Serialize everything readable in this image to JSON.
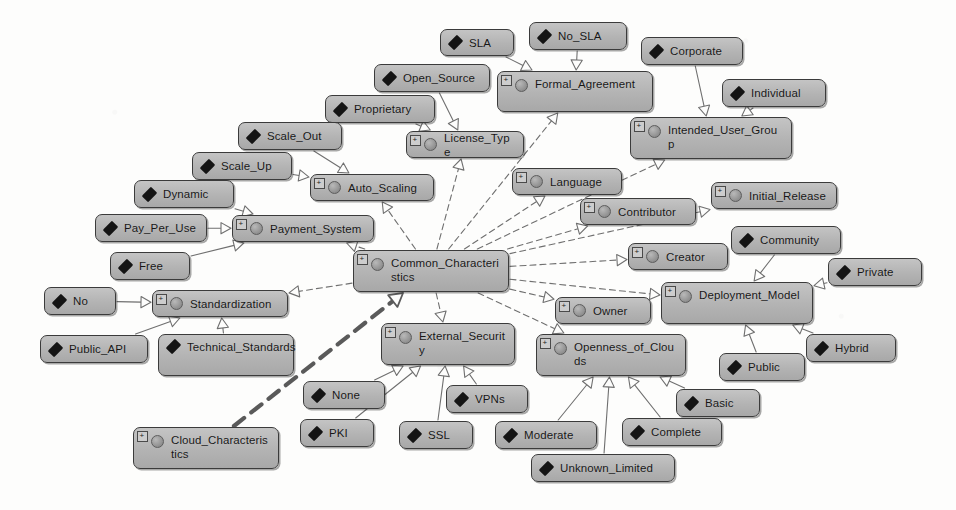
{
  "diagram": {
    "background_color": "#fdfdfc",
    "node_fill_color": "#b3b3b3",
    "node_border_color": "#3b3b3b",
    "edge_color": "#6f6f6f",
    "highlight_edge_color": "#5a5a5a",
    "expander_glyph": "+",
    "root_node": "Cloud_Characteristics",
    "hub_node": "Common_Characteristics"
  },
  "nodes": [
    {
      "id": "sla",
      "label": "SLA",
      "kind": "instance",
      "x": 440,
      "y": 29,
      "w": 74,
      "h": 27
    },
    {
      "id": "no_sla",
      "label": "No_SLA",
      "kind": "instance",
      "x": 529,
      "y": 22,
      "w": 98,
      "h": 28
    },
    {
      "id": "corporate",
      "label": "Corporate",
      "kind": "instance",
      "x": 641,
      "y": 37,
      "w": 102,
      "h": 28
    },
    {
      "id": "open_source",
      "label": "Open_Source",
      "kind": "instance",
      "x": 374,
      "y": 64,
      "w": 116,
      "h": 28
    },
    {
      "id": "formal_agreement",
      "label": "Formal_Agreement",
      "kind": "class",
      "x": 497,
      "y": 71,
      "w": 156,
      "h": 41,
      "wrap": true
    },
    {
      "id": "individual",
      "label": "Individual",
      "kind": "instance",
      "x": 722,
      "y": 79,
      "w": 104,
      "h": 28
    },
    {
      "id": "proprietary",
      "label": "Proprietary",
      "kind": "instance",
      "x": 325,
      "y": 95,
      "w": 110,
      "h": 28
    },
    {
      "id": "license_type",
      "label": "License_Type",
      "kind": "class",
      "x": 406,
      "y": 131,
      "w": 118,
      "h": 27
    },
    {
      "id": "scale_out",
      "label": "Scale_Out",
      "kind": "instance",
      "x": 238,
      "y": 122,
      "w": 104,
      "h": 28
    },
    {
      "id": "intended_user_group",
      "label": "Intended_User_Group",
      "kind": "class",
      "x": 630,
      "y": 117,
      "w": 162,
      "h": 42,
      "wrap": true
    },
    {
      "id": "scale_up",
      "label": "Scale_Up",
      "kind": "instance",
      "x": 192,
      "y": 152,
      "w": 100,
      "h": 28
    },
    {
      "id": "auto_scaling",
      "label": "Auto_Scaling",
      "kind": "class",
      "x": 310,
      "y": 174,
      "w": 124,
      "h": 27
    },
    {
      "id": "language",
      "label": "Language",
      "kind": "class",
      "x": 512,
      "y": 168,
      "w": 110,
      "h": 27
    },
    {
      "id": "initial_release",
      "label": "Initial_Release",
      "kind": "class",
      "x": 711,
      "y": 182,
      "w": 126,
      "h": 27
    },
    {
      "id": "dynamic",
      "label": "Dynamic",
      "kind": "instance",
      "x": 134,
      "y": 180,
      "w": 100,
      "h": 28
    },
    {
      "id": "contributor",
      "label": "Contributor",
      "kind": "class",
      "x": 580,
      "y": 198,
      "w": 116,
      "h": 27
    },
    {
      "id": "pay_per_use",
      "label": "Pay_Per_Use",
      "kind": "instance",
      "x": 95,
      "y": 214,
      "w": 112,
      "h": 28
    },
    {
      "id": "payment_system",
      "label": "Payment_System",
      "kind": "class",
      "x": 232,
      "y": 215,
      "w": 142,
      "h": 27
    },
    {
      "id": "community",
      "label": "Community",
      "kind": "instance",
      "x": 731,
      "y": 226,
      "w": 110,
      "h": 28
    },
    {
      "id": "free",
      "label": "Free",
      "kind": "instance",
      "x": 110,
      "y": 252,
      "w": 80,
      "h": 28
    },
    {
      "id": "creator",
      "label": "Creator",
      "kind": "class",
      "x": 628,
      "y": 243,
      "w": 100,
      "h": 27
    },
    {
      "id": "common_characteristics",
      "label": "Common_Characteristics",
      "kind": "class",
      "x": 353,
      "y": 250,
      "w": 156,
      "h": 42,
      "wrap": true
    },
    {
      "id": "private",
      "label": "Private",
      "kind": "instance",
      "x": 828,
      "y": 258,
      "w": 94,
      "h": 28
    },
    {
      "id": "no",
      "label": "No",
      "kind": "instance",
      "x": 44,
      "y": 287,
      "w": 72,
      "h": 28
    },
    {
      "id": "standardization",
      "label": "Standardization",
      "kind": "class",
      "x": 152,
      "y": 290,
      "w": 136,
      "h": 27
    },
    {
      "id": "owner",
      "label": "Owner",
      "kind": "class",
      "x": 555,
      "y": 297,
      "w": 96,
      "h": 27
    },
    {
      "id": "deployment_model",
      "label": "Deployment_Model",
      "kind": "class",
      "x": 661,
      "y": 282,
      "w": 152,
      "h": 42,
      "wrap": true
    },
    {
      "id": "external_security",
      "label": "External_Security",
      "kind": "class",
      "x": 381,
      "y": 323,
      "w": 134,
      "h": 42,
      "wrap": true
    },
    {
      "id": "openness_of_clouds",
      "label": "Openness_of_Clouds",
      "kind": "class",
      "x": 536,
      "y": 334,
      "w": 150,
      "h": 42,
      "wrap": true
    },
    {
      "id": "public_api",
      "label": "Public_API",
      "kind": "instance",
      "x": 40,
      "y": 335,
      "w": 108,
      "h": 28
    },
    {
      "id": "technical_standards",
      "label": "Technical_Standards",
      "kind": "instance",
      "x": 158,
      "y": 334,
      "w": 136,
      "h": 42,
      "wrap": true
    },
    {
      "id": "hybrid",
      "label": "Hybrid",
      "kind": "instance",
      "x": 806,
      "y": 334,
      "w": 90,
      "h": 28
    },
    {
      "id": "public",
      "label": "Public",
      "kind": "instance",
      "x": 719,
      "y": 353,
      "w": 86,
      "h": 28
    },
    {
      "id": "none",
      "label": "None",
      "kind": "instance",
      "x": 303,
      "y": 381,
      "w": 82,
      "h": 28
    },
    {
      "id": "vpns",
      "label": "VPNs",
      "kind": "instance",
      "x": 446,
      "y": 385,
      "w": 82,
      "h": 28
    },
    {
      "id": "basic",
      "label": "Basic",
      "kind": "instance",
      "x": 676,
      "y": 389,
      "w": 84,
      "h": 28
    },
    {
      "id": "pki",
      "label": "PKI",
      "kind": "instance",
      "x": 300,
      "y": 419,
      "w": 74,
      "h": 28
    },
    {
      "id": "ssl",
      "label": "SSL",
      "kind": "instance",
      "x": 399,
      "y": 421,
      "w": 74,
      "h": 28
    },
    {
      "id": "moderate",
      "label": "Moderate",
      "kind": "instance",
      "x": 495,
      "y": 421,
      "w": 102,
      "h": 28
    },
    {
      "id": "complete",
      "label": "Complete",
      "kind": "instance",
      "x": 622,
      "y": 418,
      "w": 100,
      "h": 28
    },
    {
      "id": "cloud_characteristics",
      "label": "Cloud_Characteristics",
      "kind": "class",
      "x": 133,
      "y": 427,
      "w": 146,
      "h": 42,
      "wrap": true
    },
    {
      "id": "unknown_limited",
      "label": "Unknown_Limited",
      "kind": "instance",
      "x": 531,
      "y": 454,
      "w": 144,
      "h": 28
    }
  ],
  "edges": [
    {
      "from": "sla",
      "to": "formal_agreement",
      "style": "solid",
      "arrow": "hollow-triangle"
    },
    {
      "from": "no_sla",
      "to": "formal_agreement",
      "style": "solid",
      "arrow": "hollow-triangle"
    },
    {
      "from": "corporate",
      "to": "intended_user_group",
      "style": "solid",
      "arrow": "hollow-triangle"
    },
    {
      "from": "individual",
      "to": "intended_user_group",
      "style": "solid",
      "arrow": "hollow-triangle"
    },
    {
      "from": "open_source",
      "to": "license_type",
      "style": "solid",
      "arrow": "hollow-triangle"
    },
    {
      "from": "proprietary",
      "to": "license_type",
      "style": "solid",
      "arrow": "hollow-triangle"
    },
    {
      "from": "scale_out",
      "to": "auto_scaling",
      "style": "solid",
      "arrow": "hollow-triangle"
    },
    {
      "from": "scale_up",
      "to": "auto_scaling",
      "style": "solid",
      "arrow": "hollow-triangle"
    },
    {
      "from": "dynamic",
      "to": "payment_system",
      "style": "solid",
      "arrow": "hollow-triangle"
    },
    {
      "from": "pay_per_use",
      "to": "payment_system",
      "style": "solid",
      "arrow": "hollow-triangle"
    },
    {
      "from": "free",
      "to": "payment_system",
      "style": "solid",
      "arrow": "hollow-triangle"
    },
    {
      "from": "no",
      "to": "standardization",
      "style": "solid",
      "arrow": "hollow-triangle"
    },
    {
      "from": "public_api",
      "to": "standardization",
      "style": "solid",
      "arrow": "hollow-triangle"
    },
    {
      "from": "technical_standards",
      "to": "standardization",
      "style": "solid",
      "arrow": "hollow-triangle"
    },
    {
      "from": "community",
      "to": "deployment_model",
      "style": "solid",
      "arrow": "hollow-triangle"
    },
    {
      "from": "private",
      "to": "deployment_model",
      "style": "solid",
      "arrow": "hollow-triangle"
    },
    {
      "from": "hybrid",
      "to": "deployment_model",
      "style": "solid",
      "arrow": "hollow-triangle"
    },
    {
      "from": "public",
      "to": "deployment_model",
      "style": "solid",
      "arrow": "hollow-triangle"
    },
    {
      "from": "none",
      "to": "external_security",
      "style": "solid",
      "arrow": "hollow-triangle"
    },
    {
      "from": "pki",
      "to": "external_security",
      "style": "solid",
      "arrow": "hollow-triangle"
    },
    {
      "from": "ssl",
      "to": "external_security",
      "style": "solid",
      "arrow": "hollow-triangle"
    },
    {
      "from": "vpns",
      "to": "external_security",
      "style": "solid",
      "arrow": "hollow-triangle"
    },
    {
      "from": "moderate",
      "to": "openness_of_clouds",
      "style": "solid",
      "arrow": "hollow-triangle"
    },
    {
      "from": "complete",
      "to": "openness_of_clouds",
      "style": "solid",
      "arrow": "hollow-triangle"
    },
    {
      "from": "basic",
      "to": "openness_of_clouds",
      "style": "solid",
      "arrow": "hollow-triangle"
    },
    {
      "from": "unknown_limited",
      "to": "openness_of_clouds",
      "style": "solid",
      "arrow": "hollow-triangle"
    },
    {
      "from": "common_characteristics",
      "to": "license_type",
      "style": "dashed",
      "arrow": "hollow-triangle"
    },
    {
      "from": "common_characteristics",
      "to": "formal_agreement",
      "style": "dashed",
      "arrow": "hollow-triangle"
    },
    {
      "from": "common_characteristics",
      "to": "intended_user_group",
      "style": "dashed",
      "arrow": "hollow-triangle"
    },
    {
      "from": "common_characteristics",
      "to": "auto_scaling",
      "style": "dashed",
      "arrow": "hollow-triangle"
    },
    {
      "from": "common_characteristics",
      "to": "payment_system",
      "style": "dashed",
      "arrow": "hollow-triangle"
    },
    {
      "from": "common_characteristics",
      "to": "language",
      "style": "dashed",
      "arrow": "hollow-triangle"
    },
    {
      "from": "common_characteristics",
      "to": "contributor",
      "style": "dashed",
      "arrow": "hollow-triangle"
    },
    {
      "from": "common_characteristics",
      "to": "initial_release",
      "style": "dashed",
      "arrow": "hollow-triangle"
    },
    {
      "from": "common_characteristics",
      "to": "creator",
      "style": "dashed",
      "arrow": "hollow-triangle"
    },
    {
      "from": "common_characteristics",
      "to": "owner",
      "style": "dashed",
      "arrow": "hollow-triangle"
    },
    {
      "from": "common_characteristics",
      "to": "deployment_model",
      "style": "dashed",
      "arrow": "hollow-triangle"
    },
    {
      "from": "common_characteristics",
      "to": "standardization",
      "style": "dashed",
      "arrow": "hollow-triangle"
    },
    {
      "from": "common_characteristics",
      "to": "external_security",
      "style": "dashed",
      "arrow": "hollow-triangle"
    },
    {
      "from": "common_characteristics",
      "to": "openness_of_clouds",
      "style": "dashed",
      "arrow": "hollow-triangle"
    },
    {
      "from": "cloud_characteristics",
      "to": "common_characteristics",
      "style": "thick-dashed",
      "arrow": "hollow-triangle"
    }
  ]
}
